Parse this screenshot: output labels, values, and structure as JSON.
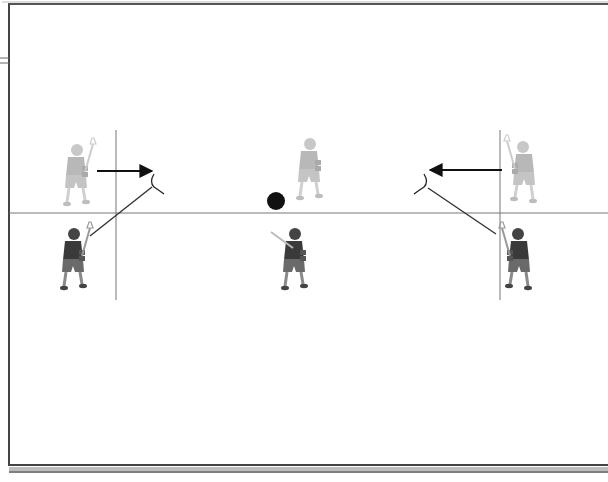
{
  "diagram": {
    "title": "",
    "colors": {
      "background": "#ffffff",
      "border": "#444444",
      "border_shadow": "#9a9a9a",
      "lines": "#555555",
      "arrow": "#111111",
      "ball": "#111111",
      "light_player": "#b8b8b8",
      "dark_player": "#3a3a3a",
      "dark_player_shorts": "#6a6a6a"
    },
    "guides": {
      "horizontal_line_y": 213,
      "vertical_lines": [
        {
          "x": 116,
          "y1": 130,
          "y2": 300
        },
        {
          "x": 500,
          "y1": 130,
          "y2": 300
        }
      ]
    },
    "players": [
      {
        "id": "left-top",
        "shade": "light",
        "x": 75,
        "y": 178,
        "facing": "right"
      },
      {
        "id": "left-bottom",
        "shade": "dark",
        "x": 72,
        "y": 262,
        "facing": "right"
      },
      {
        "id": "center-top",
        "shade": "light",
        "x": 308,
        "y": 172,
        "facing": "front"
      },
      {
        "id": "center-bottom",
        "shade": "dark",
        "x": 293,
        "y": 262,
        "facing": "back"
      },
      {
        "id": "right-top",
        "shade": "light",
        "x": 525,
        "y": 175,
        "facing": "left"
      },
      {
        "id": "right-bottom",
        "shade": "dark",
        "x": 520,
        "y": 262,
        "facing": "left"
      }
    ],
    "ball": {
      "x": 276,
      "y": 201,
      "r": 9
    },
    "arrows": [
      {
        "id": "left-arrow",
        "x1": 97,
        "y1": 171,
        "x2": 152,
        "y2": 171
      },
      {
        "id": "right-arrow",
        "x1": 502,
        "y1": 170,
        "x2": 430,
        "y2": 170
      }
    ],
    "pass_lines": [
      {
        "id": "left-pass",
        "x1": 90,
        "y1": 236,
        "x2": 152,
        "y2": 187
      },
      {
        "id": "right-pass",
        "x1": 496,
        "y1": 234,
        "x2": 428,
        "y2": 188
      }
    ],
    "stick_heads": [
      {
        "id": "left-stick-head",
        "x": 158,
        "y": 184
      },
      {
        "id": "right-stick-head",
        "x": 420,
        "y": 184
      }
    ]
  }
}
